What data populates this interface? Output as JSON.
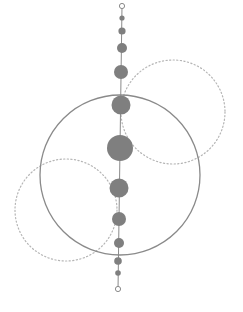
{
  "diagram": {
    "width": 243,
    "height": 312,
    "colors": {
      "fill": "#7f7f7f",
      "stroke": "#8a8a8a",
      "dotted": "#b5b5b5",
      "background": "#ffffff"
    },
    "spine": {
      "x": 121,
      "y1": 6,
      "y2": 290
    },
    "big_circle": {
      "cx": 120,
      "cy": 175,
      "r": 80
    },
    "dotted_circles": [
      {
        "cx": 173,
        "cy": 112,
        "r": 52
      },
      {
        "cx": 66,
        "cy": 210,
        "r": 51
      }
    ],
    "nodes": [
      {
        "cx": 122,
        "cy": 6,
        "r": 2.6,
        "hollow": true
      },
      {
        "cx": 122,
        "cy": 18,
        "r": 2.6,
        "hollow": false
      },
      {
        "cx": 122,
        "cy": 31,
        "r": 3.6,
        "hollow": false
      },
      {
        "cx": 122,
        "cy": 48,
        "r": 5,
        "hollow": false
      },
      {
        "cx": 121,
        "cy": 72,
        "r": 7,
        "hollow": false
      },
      {
        "cx": 121,
        "cy": 105,
        "r": 9.5,
        "hollow": false
      },
      {
        "cx": 120,
        "cy": 148,
        "r": 13,
        "hollow": false
      },
      {
        "cx": 119,
        "cy": 188,
        "r": 9.5,
        "hollow": false
      },
      {
        "cx": 119,
        "cy": 219,
        "r": 7,
        "hollow": false
      },
      {
        "cx": 119,
        "cy": 243,
        "r": 5,
        "hollow": false
      },
      {
        "cx": 118,
        "cy": 261,
        "r": 3.8,
        "hollow": false
      },
      {
        "cx": 118,
        "cy": 273,
        "r": 2.8,
        "hollow": false
      },
      {
        "cx": 118,
        "cy": 289,
        "r": 2.6,
        "hollow": true
      }
    ]
  }
}
